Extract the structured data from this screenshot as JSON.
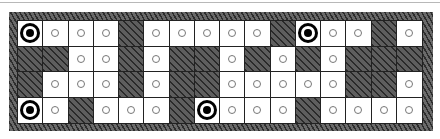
{
  "board": {
    "rows": 4,
    "cols": 16,
    "legend": {
      "T": "target",
      "o": "dot",
      "W": "wall"
    },
    "grid": [
      [
        "T",
        "o",
        "o",
        "o",
        "W",
        "o",
        "o",
        "o",
        "o",
        "o",
        "W",
        "T",
        "o",
        "o",
        "W",
        "o"
      ],
      [
        "W",
        "W",
        "o",
        "o",
        "W",
        "o",
        "W",
        "W",
        "o",
        "W",
        "o",
        "W",
        "o",
        "W",
        "W",
        "W"
      ],
      [
        "W",
        "o",
        "o",
        "o",
        "W",
        "o",
        "W",
        "W",
        "o",
        "o",
        "o",
        "o",
        "o",
        "W",
        "W",
        "o"
      ],
      [
        "T",
        "o",
        "W",
        "o",
        "o",
        "o",
        "W",
        "T",
        "o",
        "o",
        "o",
        "W",
        "o",
        "o",
        "o",
        "o"
      ]
    ]
  },
  "colors": {
    "wall": "#4a4a4a",
    "floor": "#ffffff",
    "gridline": "#222222",
    "target": "#000000",
    "dot_outline": "#777777"
  }
}
